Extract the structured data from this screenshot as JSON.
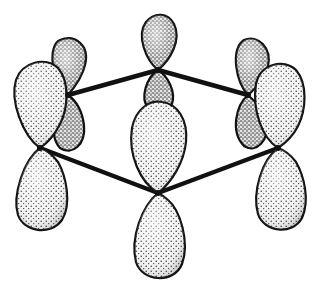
{
  "diagram": {
    "type": "molecular-orbital-illustration",
    "colors": {
      "background": "#ffffff",
      "outline": "#111111",
      "stipple": "#1a1a1a",
      "lobe_fill": "#f2f2f2"
    },
    "ring": {
      "shape": "hexagon",
      "atoms": [
        {
          "id": "C1",
          "position": "top",
          "x": 158,
          "y": 70
        },
        {
          "id": "C2",
          "position": "upper-right",
          "x": 248,
          "y": 95
        },
        {
          "id": "C3",
          "position": "lower-right",
          "x": 278,
          "y": 148
        },
        {
          "id": "C4",
          "position": "bottom",
          "x": 158,
          "y": 193
        },
        {
          "id": "C5",
          "position": "lower-left",
          "x": 40,
          "y": 148
        },
        {
          "id": "C6",
          "position": "upper-left",
          "x": 68,
          "y": 95
        }
      ],
      "visible_bonds": [
        [
          "C6",
          "C1"
        ],
        [
          "C1",
          "C2"
        ],
        [
          "C5",
          "C4"
        ],
        [
          "C4",
          "C3"
        ]
      ]
    },
    "orbitals_count": 6,
    "labels": []
  }
}
